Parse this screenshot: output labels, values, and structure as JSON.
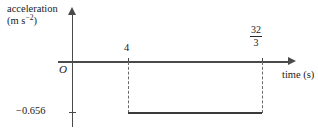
{
  "figure": {
    "kind": "acceleration-time-graph",
    "background_color": "#ffffff",
    "line_color": "#3a3a3a",
    "axis_color": "#4a4a4a",
    "dash_color": "#6b6b6b"
  },
  "axes": {
    "y_label_name": "acceleration",
    "y_label_units": "(m s",
    "y_label_units_exp": "−2",
    "y_label_units_close": ")",
    "x_label": "time (s)",
    "origin_label": "O"
  },
  "ticks": {
    "x": [
      {
        "label": "4",
        "value": 4
      },
      {
        "label_numerator": "32",
        "label_denominator": "3",
        "value": 10.6667
      }
    ],
    "y": [
      {
        "label": "−0.656",
        "value": -0.656
      }
    ]
  },
  "chart_data": {
    "type": "line",
    "title": "",
    "xlabel": "time (s)",
    "ylabel": "acceleration (m s^-2)",
    "xlim": [
      0,
      12
    ],
    "ylim": [
      -0.8,
      0.25
    ],
    "grid": false,
    "legend": "none",
    "x_tick_labels": [
      "4",
      "32/3"
    ],
    "x_tick_values": [
      4,
      10.6667
    ],
    "y_tick_labels": [
      "-0.656"
    ],
    "y_tick_values": [
      -0.656
    ],
    "series": [
      {
        "name": "acceleration",
        "style": "solid",
        "x": [
          4,
          10.6667
        ],
        "values": [
          -0.656,
          -0.656
        ]
      }
    ],
    "annotations": [
      {
        "type": "dashed-vertical",
        "x": 4,
        "from": 0,
        "to": -0.656
      },
      {
        "type": "dashed-vertical",
        "x": 10.6667,
        "from": 0,
        "to": -0.656
      }
    ]
  }
}
